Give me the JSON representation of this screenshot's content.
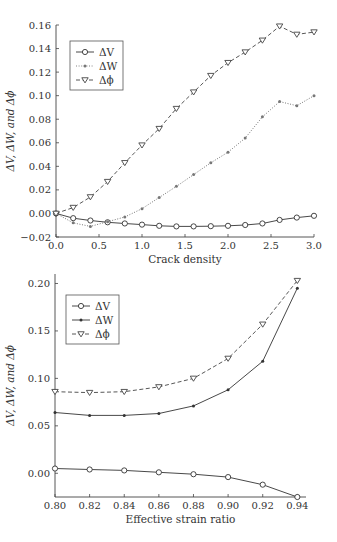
{
  "chart_data": [
    {
      "type": "line",
      "title": "",
      "xlabel": "Crack density",
      "ylabel": "ΔV, ΔW, and Δϕ",
      "xlim": [
        0.0,
        3.0
      ],
      "ylim": [
        -0.02,
        0.16
      ],
      "xticks": [
        "0.0",
        "0.5",
        "1.0",
        "1.5",
        "2.0",
        "2.5",
        "3.0"
      ],
      "yticks": [
        "−0.02",
        "0.00",
        "0.02",
        "0.04",
        "0.06",
        "0.08",
        "0.10",
        "0.12",
        "0.14",
        "0.16"
      ],
      "grid": false,
      "legend_position": "upper left",
      "x": [
        0.0,
        0.2,
        0.4,
        0.6,
        0.8,
        1.0,
        1.2,
        1.4,
        1.6,
        1.8,
        2.0,
        2.2,
        2.4,
        2.6,
        2.8,
        3.0
      ],
      "series": [
        {
          "name": "ΔV",
          "style": "solid",
          "marker": "circle",
          "values": [
            0.0,
            -0.004,
            -0.006,
            -0.0075,
            -0.0085,
            -0.0095,
            -0.0105,
            -0.011,
            -0.011,
            -0.0108,
            -0.0105,
            -0.0098,
            -0.0085,
            -0.0055,
            -0.0035,
            -0.002
          ]
        },
        {
          "name": "ΔW",
          "style": "dotted",
          "marker": "dot",
          "values": [
            0.0,
            -0.008,
            -0.011,
            -0.007,
            -0.003,
            0.004,
            0.0135,
            0.023,
            0.033,
            0.043,
            0.052,
            0.064,
            0.082,
            0.095,
            0.0915,
            0.1
          ]
        },
        {
          "name": "Δϕ",
          "style": "dashed",
          "marker": "triangle-down",
          "values": [
            0.0,
            0.005,
            0.014,
            0.027,
            0.043,
            0.058,
            0.072,
            0.089,
            0.103,
            0.117,
            0.128,
            0.137,
            0.147,
            0.159,
            0.152,
            0.154
          ]
        }
      ]
    },
    {
      "type": "line",
      "title": "",
      "xlabel": "Effective strain ratio",
      "ylabel": "ΔV, ΔW, and Δϕ",
      "xlim": [
        0.8,
        0.945
      ],
      "ylim": [
        -0.025,
        0.21
      ],
      "xticks": [
        "0.80",
        "0.82",
        "0.84",
        "0.86",
        "0.88",
        "0.90",
        "0.92",
        "0.94"
      ],
      "yticks": [
        "0.00",
        "0.05",
        "0.10",
        "0.15",
        "0.20"
      ],
      "grid": false,
      "legend_position": "upper left",
      "x": [
        0.8,
        0.82,
        0.84,
        0.86,
        0.88,
        0.9,
        0.92,
        0.94
      ],
      "series": [
        {
          "name": "ΔV",
          "style": "solid",
          "marker": "circle",
          "values": [
            0.005,
            0.004,
            0.003,
            0.001,
            -0.001,
            -0.004,
            -0.012,
            -0.025
          ]
        },
        {
          "name": "ΔW",
          "style": "solid",
          "marker": "dot",
          "values": [
            0.064,
            0.061,
            0.061,
            0.063,
            0.071,
            0.088,
            0.118,
            0.195
          ]
        },
        {
          "name": "Δϕ",
          "style": "dashed",
          "marker": "triangle-down",
          "values": [
            0.086,
            0.085,
            0.086,
            0.091,
            0.1,
            0.121,
            0.157,
            0.203
          ]
        }
      ]
    }
  ],
  "colors": {
    "line": "#333333",
    "dotted": "#777777",
    "dashed": "#444444"
  }
}
